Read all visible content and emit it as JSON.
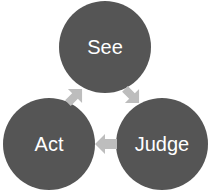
{
  "diagram": {
    "type": "cycle",
    "nodes": [
      {
        "label": "See",
        "color": "#555555"
      },
      {
        "label": "Judge",
        "color": "#555555"
      },
      {
        "label": "Act",
        "color": "#555555"
      }
    ],
    "arrow_color": "#bdbdbd",
    "edges": [
      {
        "from": "See",
        "to": "Judge"
      },
      {
        "from": "Judge",
        "to": "Act"
      },
      {
        "from": "Act",
        "to": "See"
      }
    ]
  }
}
